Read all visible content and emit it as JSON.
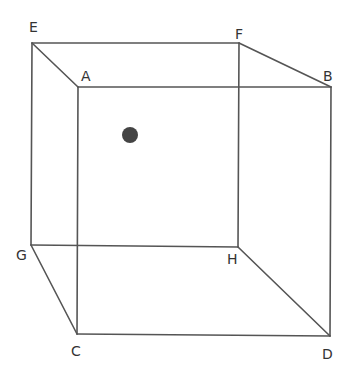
{
  "diagram": {
    "type": "cube-wireframe",
    "colors": {
      "edge": "#555555",
      "label": "#333333",
      "dot": "#444444",
      "background": "#ffffff"
    },
    "vertices": {
      "A": {
        "x": 78,
        "y": 87,
        "label": "A",
        "lx": 81,
        "ly": 81
      },
      "B": {
        "x": 331,
        "y": 87,
        "label": "B",
        "lx": 323,
        "ly": 81
      },
      "C": {
        "x": 77,
        "y": 334,
        "label": "C",
        "lx": 71,
        "ly": 356
      },
      "D": {
        "x": 330,
        "y": 336,
        "label": "D",
        "lx": 322,
        "ly": 359
      },
      "E": {
        "x": 32,
        "y": 43,
        "label": "E",
        "lx": 29,
        "ly": 32
      },
      "F": {
        "x": 239,
        "y": 43,
        "label": "F",
        "lx": 235,
        "ly": 39
      },
      "G": {
        "x": 31,
        "y": 245,
        "label": "G",
        "lx": 16,
        "ly": 260
      },
      "H": {
        "x": 238,
        "y": 247,
        "label": "H",
        "lx": 227,
        "ly": 264
      }
    },
    "edges": [
      [
        "E",
        "F"
      ],
      [
        "F",
        "H"
      ],
      [
        "H",
        "G"
      ],
      [
        "G",
        "E"
      ],
      [
        "A",
        "B"
      ],
      [
        "B",
        "D"
      ],
      [
        "D",
        "C"
      ],
      [
        "C",
        "A"
      ],
      [
        "E",
        "A"
      ],
      [
        "F",
        "B"
      ],
      [
        "G",
        "C"
      ],
      [
        "H",
        "D"
      ]
    ],
    "point": {
      "x": 130,
      "y": 135,
      "r": 8,
      "name": "dot"
    }
  }
}
